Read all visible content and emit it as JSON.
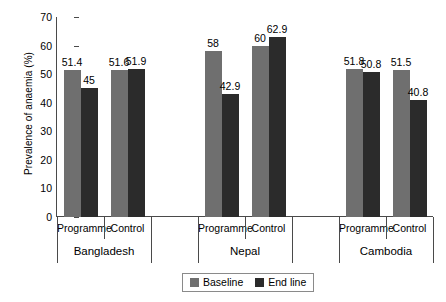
{
  "chart_data": {
    "type": "bar",
    "title": "",
    "xlabel": "",
    "ylabel": "Prevalence of anaemia (%)",
    "ylim": [
      0,
      70
    ],
    "yticks": [
      0,
      10,
      20,
      30,
      40,
      50,
      60,
      70
    ],
    "grid": false,
    "legend_position": "bottom-right",
    "legend": [
      "Baseline",
      "End line"
    ],
    "groups": [
      "Bangladesh",
      "Nepal",
      "Cambodia"
    ],
    "subgroups": [
      "Programme",
      "Control"
    ],
    "categories": [
      "Bangladesh Programme",
      "Bangladesh Control",
      "Nepal Programme",
      "Nepal Control",
      "Cambodia Programme",
      "Cambodia Control"
    ],
    "series": [
      {
        "name": "Baseline",
        "color": "#6f6f6f",
        "values": [
          51.4,
          51.6,
          58,
          60,
          51.8,
          51.5
        ]
      },
      {
        "name": "End line",
        "color": "#2b2b2b",
        "values": [
          45,
          51.9,
          42.9,
          62.9,
          50.8,
          40.8
        ]
      }
    ],
    "data_labels": [
      {
        "text": "51.4"
      },
      {
        "text": "45"
      },
      {
        "text": "51.6"
      },
      {
        "text": "51.9"
      },
      {
        "text": "58"
      },
      {
        "text": "42.9"
      },
      {
        "text": "60"
      },
      {
        "text": "62.9"
      },
      {
        "text": "51.8"
      },
      {
        "text": "50.8"
      },
      {
        "text": "51.5"
      },
      {
        "text": "40.8"
      }
    ]
  },
  "axis": {
    "y_title": "Prevalence of anaemia (%)",
    "y_ticks": [
      "70",
      "60",
      "50",
      "40",
      "30",
      "20",
      "10",
      "0"
    ]
  },
  "x_tier1": [
    {
      "label": "Programme"
    },
    {
      "label": "Control"
    },
    {
      "label": "Programme"
    },
    {
      "label": "Control"
    },
    {
      "label": "Programme"
    },
    {
      "label": "Control"
    }
  ],
  "x_tier2": [
    {
      "label": "Bangladesh"
    },
    {
      "label": "Nepal"
    },
    {
      "label": "Cambodia"
    }
  ],
  "legend": {
    "baseline_label": "Baseline",
    "endline_label": "End line"
  }
}
